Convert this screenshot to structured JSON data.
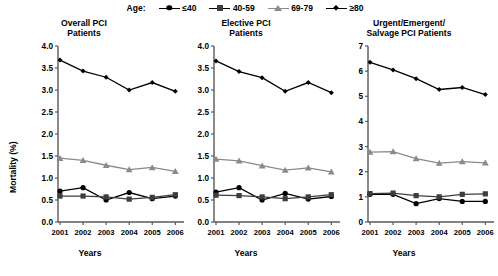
{
  "legend": {
    "title": "Age:",
    "items": [
      {
        "label": "≤40",
        "marker": "circle-marker",
        "color": "#000000"
      },
      {
        "label": "40-59",
        "marker": "square-marker",
        "color": "#3d3d3d"
      },
      {
        "label": "69-79",
        "marker": "triangle-marker",
        "color": "#8a8a8a"
      },
      {
        "label": "≥80",
        "marker": "diamond-marker",
        "color": "#000000"
      }
    ]
  },
  "axis_titles": {
    "y": "Mortality (%)",
    "x": "Years"
  },
  "caption": "",
  "chart_data": [
    {
      "type": "line",
      "title": "Overall PCI Patients",
      "title_lines": [
        "Overall PCI",
        "Patients"
      ],
      "xlabel": "Years",
      "ylabel": "Mortality (%)",
      "categories": [
        "2001",
        "2002",
        "2003",
        "2004",
        "2005",
        "2006"
      ],
      "xlim": [
        2001,
        2006
      ],
      "ylim": [
        0.0,
        4.0
      ],
      "yticks": [
        "0.0",
        "0.5",
        "1.0",
        "1.5",
        "2.0",
        "2.5",
        "3.0",
        "3.5",
        "4.0"
      ],
      "ytick_values": [
        0.0,
        0.5,
        1.0,
        1.5,
        2.0,
        2.5,
        3.0,
        3.5,
        4.0
      ],
      "grid": false,
      "legend_position": "top",
      "series": [
        {
          "name": "≤40",
          "marker": "circle",
          "color": "#000000",
          "values": [
            0.7,
            0.78,
            0.5,
            0.67,
            0.53,
            0.59
          ]
        },
        {
          "name": "40-59",
          "marker": "square",
          "color": "#3d3d3d",
          "values": [
            0.59,
            0.59,
            0.57,
            0.52,
            0.56,
            0.62
          ]
        },
        {
          "name": "69-79",
          "marker": "triangle",
          "color": "#8a8a8a",
          "values": [
            1.45,
            1.4,
            1.29,
            1.19,
            1.24,
            1.15
          ]
        },
        {
          "name": "≥80",
          "marker": "diamond",
          "color": "#000000",
          "values": [
            3.68,
            3.43,
            3.29,
            3.0,
            3.17,
            2.97
          ]
        }
      ]
    },
    {
      "type": "line",
      "title": "Elective PCI Patients",
      "title_lines": [
        "Elective PCI",
        "Patients"
      ],
      "xlabel": "Years",
      "ylabel": "",
      "categories": [
        "2001",
        "2002",
        "2003",
        "2004",
        "2005",
        "2006"
      ],
      "xlim": [
        2001,
        2006
      ],
      "ylim": [
        0.0,
        4.0
      ],
      "yticks": [
        "0.0",
        "0.5",
        "1.0",
        "1.5",
        "2.0",
        "2.5",
        "3.0",
        "3.5",
        "4.0"
      ],
      "ytick_values": [
        0.0,
        0.5,
        1.0,
        1.5,
        2.0,
        2.5,
        3.0,
        3.5,
        4.0
      ],
      "grid": false,
      "legend_position": "top",
      "series": [
        {
          "name": "≤40",
          "marker": "circle",
          "color": "#000000",
          "values": [
            0.68,
            0.78,
            0.5,
            0.65,
            0.52,
            0.58
          ]
        },
        {
          "name": "40-59",
          "marker": "square",
          "color": "#3d3d3d",
          "values": [
            0.61,
            0.6,
            0.57,
            0.53,
            0.57,
            0.62
          ]
        },
        {
          "name": "69-79",
          "marker": "triangle",
          "color": "#8a8a8a",
          "values": [
            1.43,
            1.39,
            1.28,
            1.18,
            1.23,
            1.14
          ]
        },
        {
          "name": "≥80",
          "marker": "diamond",
          "color": "#000000",
          "values": [
            3.66,
            3.42,
            3.28,
            2.97,
            3.17,
            2.94
          ]
        }
      ]
    },
    {
      "type": "line",
      "title": "Urgent/Emergent/ Salvage PCI Patients",
      "title_lines": [
        "Urgent/Emergent/",
        "Salvage PCI Patients"
      ],
      "xlabel": "Years",
      "ylabel": "",
      "categories": [
        "2001",
        "2002",
        "2003",
        "2004",
        "2005",
        "2006"
      ],
      "xlim": [
        2001,
        2006
      ],
      "ylim": [
        0,
        7
      ],
      "yticks": [
        "0",
        "1",
        "2",
        "3",
        "4",
        "5",
        "6",
        "7"
      ],
      "ytick_values": [
        0,
        1,
        2,
        3,
        4,
        5,
        6,
        7
      ],
      "grid": false,
      "legend_position": "top",
      "series": [
        {
          "name": "≤40",
          "marker": "circle",
          "color": "#000000",
          "values": [
            1.1,
            1.1,
            0.73,
            0.93,
            0.82,
            0.82
          ]
        },
        {
          "name": "40-59",
          "marker": "square",
          "color": "#3d3d3d",
          "values": [
            1.13,
            1.15,
            1.05,
            1.0,
            1.1,
            1.12
          ]
        },
        {
          "name": "69-79",
          "marker": "triangle",
          "color": "#8a8a8a",
          "values": [
            2.78,
            2.8,
            2.52,
            2.34,
            2.4,
            2.35
          ]
        },
        {
          "name": "≥80",
          "marker": "diamond",
          "color": "#000000",
          "values": [
            6.35,
            6.05,
            5.7,
            5.27,
            5.35,
            5.07
          ]
        }
      ]
    }
  ]
}
